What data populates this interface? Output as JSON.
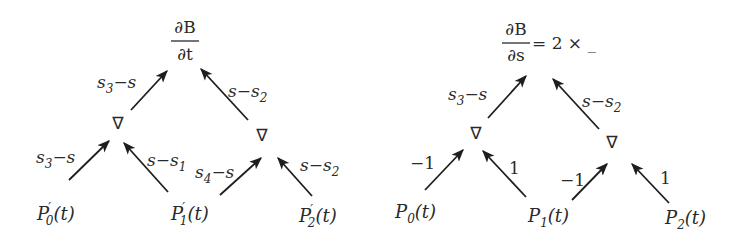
{
  "diagram": {
    "left": {
      "title": {
        "numerator": "∂B",
        "denominator": "∂t"
      },
      "top_edges": [
        {
          "label_main": "s",
          "label_sub": "3",
          "label_rest": "−s"
        },
        {
          "label_main": "s−s",
          "label_sub": "2"
        }
      ],
      "nabla_nodes": [
        "∇",
        "∇"
      ],
      "bottom_edges": [
        {
          "label_main": "s",
          "label_sub": "3",
          "label_rest": "−s"
        },
        {
          "label_main": "s−s",
          "label_sub": "1"
        },
        {
          "label_main": "s",
          "label_sub": "4",
          "label_rest": "−s"
        },
        {
          "label_main": "s−s",
          "label_sub": "2"
        }
      ],
      "leaves": [
        {
          "base": "P",
          "prime": "′",
          "sub": "0",
          "arg": "(t)"
        },
        {
          "base": "P",
          "prime": "′",
          "sub": "1",
          "arg": "(t)"
        },
        {
          "base": "P",
          "prime": "′",
          "sub": "2",
          "arg": "(t)"
        }
      ]
    },
    "right": {
      "title": {
        "numerator": "∂B",
        "denominator": "∂s",
        "suffix": "= 2 × _"
      },
      "top_edges": [
        {
          "label_main": "s",
          "label_sub": "3",
          "label_rest": "−s"
        },
        {
          "label_main": "s−s",
          "label_sub": "2"
        }
      ],
      "nabla_nodes": [
        "∇",
        "∇"
      ],
      "bottom_edges": [
        {
          "label": "−1"
        },
        {
          "label": "1"
        },
        {
          "label": "−1"
        },
        {
          "label": "1"
        }
      ],
      "leaves": [
        {
          "base": "P",
          "sub": "0",
          "arg": "(t)"
        },
        {
          "base": "P",
          "sub": "1",
          "arg": "(t)"
        },
        {
          "base": "P",
          "sub": "2",
          "arg": "(t)"
        }
      ]
    }
  }
}
